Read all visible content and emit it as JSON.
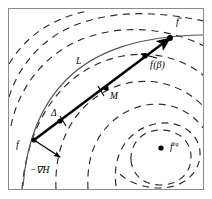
{
  "figure": {
    "kind": "vector-field-contour-diagram",
    "frame": {
      "border_color": "#8a8a8a",
      "background_color": "#ffffff",
      "x": 8,
      "y": 8,
      "width": 196,
      "height": 182
    },
    "colors": {
      "contour_dashed": "#2b2b2b",
      "manifold_curve": "#555555",
      "chord_arrow": "#000000",
      "marker": "#000000",
      "text": "#000000"
    },
    "labels": [
      {
        "id": "f-start",
        "text": "f",
        "sup": "",
        "x": 16,
        "y": 146,
        "size": 10
      },
      {
        "id": "f-star",
        "text": "f",
        "sup": "*",
        "x": 178,
        "y": 22,
        "size": 10
      },
      {
        "id": "f-beta",
        "text": "f",
        "sup": "",
        "x": 152,
        "y": 62,
        "size": 10,
        "suffix": "(β)"
      },
      {
        "id": "f-eq",
        "text": "f",
        "sup": "eq",
        "x": 172,
        "y": 148,
        "size": 10
      },
      {
        "id": "curve-L",
        "text": "L",
        "sup": "",
        "x": 78,
        "y": 62,
        "size": 9
      },
      {
        "id": "point-M",
        "text": "M",
        "sup": "",
        "x": 112,
        "y": 96,
        "size": 9
      },
      {
        "id": "delta",
        "text": "Δ",
        "sup": "",
        "x": 54,
        "y": 115,
        "size": 9
      },
      {
        "id": "neg-grad-H",
        "text": "−∇H",
        "sup": "",
        "x": 34,
        "y": 170,
        "size": 9
      }
    ],
    "markers": [
      {
        "id": "marker-f-start",
        "x": 34,
        "y": 140
      },
      {
        "id": "marker-delta",
        "x": 60,
        "y": 121
      },
      {
        "id": "marker-M",
        "x": 106,
        "y": 88
      },
      {
        "id": "marker-f-beta",
        "x": 145,
        "y": 56
      },
      {
        "id": "marker-f-star",
        "x": 170,
        "y": 38
      },
      {
        "id": "marker-f-eq",
        "x": 161,
        "y": 148
      }
    ],
    "chord": {
      "id": "chord-f-to-fstar",
      "from_x": 34,
      "from_y": 140,
      "to_x": 170,
      "to_y": 38,
      "stroke_width": 2.4
    },
    "gradient_arrow": {
      "id": "neg-grad-arrow",
      "from_x": 34,
      "from_y": 140,
      "to_x": 62,
      "to_y": 158
    },
    "beta_arrow": {
      "id": "f-beta-pointer",
      "from_x": 156,
      "from_y": 58,
      "to_x": 139,
      "to_y": 54
    },
    "manifold_curve": {
      "id": "curve-L-path",
      "d": "M 23,186 C 26,150 36,110 66,80 C 96,50 140,36 204,35"
    },
    "contours": [
      {
        "id": "contour-outer-1",
        "d": "M 9,64 C 26,36 52,18 88,11"
      },
      {
        "id": "contour-outer-2",
        "d": "M 9,97 C 20,62 46,34 84,22 C 122,10 160,12 204,21"
      },
      {
        "id": "contour-outer-3",
        "d": "M 11,126 C 18,90 42,56 80,40 C 122,23 168,28 204,46"
      },
      {
        "id": "contour-mid-1",
        "d": "M 22,189 C 26,140 46,94 86,70 C 128,45 176,52 204,76"
      },
      {
        "id": "contour-mid-2",
        "d": "M 56,189 C 54,146 72,110 104,92 C 140,72 180,82 203,106"
      },
      {
        "id": "contour-mid-3",
        "d": "M 88,189 C 86,152 100,126 126,112 C 156,96 188,106 203,128"
      },
      {
        "id": "contour-inner-1",
        "d": "M 116,186 C 112,156 126,134 148,126 C 176,116 199,132 200,152 C 201,172 184,188 160,188 C 140,188 124,180 116,170"
      },
      {
        "id": "contour-inner-2",
        "d": "M 131,160 C 130,142 144,130 161,130 C 180,130 192,143 191,159 C 190,175 177,185 160,185 C 144,185 132,175 131,160"
      }
    ],
    "tick_marks": [
      {
        "id": "tick-L-1",
        "x1": 60,
        "y1": 116,
        "x2": 66,
        "y2": 126
      },
      {
        "id": "tick-L-2",
        "x1": 98,
        "y1": 86,
        "x2": 104,
        "y2": 96
      }
    ]
  }
}
